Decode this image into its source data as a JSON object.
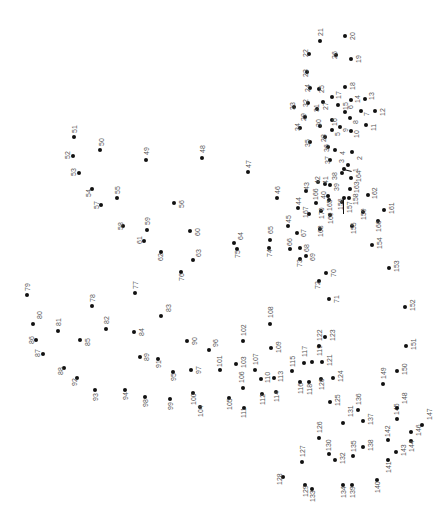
{
  "puzzle": {
    "type": "connect-the-dots",
    "orientation": "rotated-90",
    "dots": [
      {
        "n": "1",
        "x": 348,
        "y": 165,
        "lx": 352,
        "ly": 172
      },
      {
        "n": "2",
        "x": 352,
        "y": 152,
        "lx": 356,
        "ly": 160
      },
      {
        "n": "3",
        "x": 344,
        "y": 169,
        "lx": 338,
        "ly": 163
      },
      {
        "n": "4",
        "x": 335,
        "y": 150,
        "lx": 339,
        "ly": 155
      },
      {
        "n": "5",
        "x": 332,
        "y": 130,
        "lx": 334,
        "ly": 136
      },
      {
        "n": "6",
        "x": 345,
        "y": 112,
        "lx": 347,
        "ly": 109
      },
      {
        "n": "7",
        "x": 361,
        "y": 111,
        "lx": 363,
        "ly": 116
      },
      {
        "n": "8",
        "x": 350,
        "y": 118,
        "lx": 352,
        "ly": 124
      },
      {
        "n": "9",
        "x": 340,
        "y": 127,
        "lx": 342,
        "ly": 132
      },
      {
        "n": "10",
        "x": 351,
        "y": 131,
        "lx": 353,
        "ly": 138
      },
      {
        "n": "11",
        "x": 366,
        "y": 125,
        "lx": 370,
        "ly": 131
      },
      {
        "n": "12",
        "x": 375,
        "y": 111,
        "lx": 379,
        "ly": 116
      },
      {
        "n": "13",
        "x": 365,
        "y": 99,
        "lx": 368,
        "ly": 100
      },
      {
        "n": "14",
        "x": 351,
        "y": 100,
        "lx": 354,
        "ly": 103
      },
      {
        "n": "15",
        "x": 338,
        "y": 105,
        "lx": 342,
        "ly": 110
      },
      {
        "n": "16",
        "x": 332,
        "y": 120,
        "lx": 331,
        "ly": 126
      },
      {
        "n": "17",
        "x": 332,
        "y": 97,
        "lx": 335,
        "ly": 99
      },
      {
        "n": "18",
        "x": 345,
        "y": 87,
        "lx": 349,
        "ly": 90
      },
      {
        "n": "19",
        "x": 351,
        "y": 59,
        "lx": 355,
        "ly": 63
      },
      {
        "n": "20",
        "x": 345,
        "y": 36,
        "lx": 349,
        "ly": 40
      },
      {
        "n": "21",
        "x": 320,
        "y": 41,
        "lx": 317,
        "ly": 36
      },
      {
        "n": "22",
        "x": 309,
        "y": 54,
        "lx": 302,
        "ly": 57
      },
      {
        "n": "23",
        "x": 307,
        "y": 72,
        "lx": 302,
        "ly": 77
      },
      {
        "n": "24",
        "x": 310,
        "y": 88,
        "lx": 304,
        "ly": 92
      },
      {
        "n": "25",
        "x": 319,
        "y": 89,
        "lx": 318,
        "ly": 93
      },
      {
        "n": "26",
        "x": 336,
        "y": 55,
        "lx": 331,
        "ly": 59
      },
      {
        "n": "27",
        "x": 323,
        "y": 102,
        "lx": 322,
        "ly": 110
      },
      {
        "n": "28",
        "x": 325,
        "y": 137,
        "lx": 320,
        "ly": 142
      },
      {
        "n": "29",
        "x": 305,
        "y": 117,
        "lx": 300,
        "ly": 121
      },
      {
        "n": "30",
        "x": 320,
        "y": 126,
        "lx": 315,
        "ly": 127
      },
      {
        "n": "31",
        "x": 317,
        "y": 109,
        "lx": 313,
        "ly": 112
      },
      {
        "n": "32",
        "x": 308,
        "y": 103,
        "lx": 302,
        "ly": 107
      },
      {
        "n": "33",
        "x": 294,
        "y": 107,
        "lx": 289,
        "ly": 110
      },
      {
        "n": "34",
        "x": 300,
        "y": 128,
        "lx": 294,
        "ly": 131
      },
      {
        "n": "35",
        "x": 310,
        "y": 142,
        "lx": 304,
        "ly": 147
      },
      {
        "n": "36",
        "x": 328,
        "y": 147,
        "lx": 323,
        "ly": 152
      },
      {
        "n": "37",
        "x": 330,
        "y": 160,
        "lx": 324,
        "ly": 164
      },
      {
        "n": "38",
        "x": 342,
        "y": 173,
        "lx": 331,
        "ly": 180
      },
      {
        "n": "39",
        "x": 330,
        "y": 185,
        "lx": 333,
        "ly": 191
      },
      {
        "n": "40",
        "x": 328,
        "y": 196,
        "lx": 320,
        "ly": 199
      },
      {
        "n": "41",
        "x": 325,
        "y": 184,
        "lx": 322,
        "ly": 184
      },
      {
        "n": "42",
        "x": 318,
        "y": 182,
        "lx": 314,
        "ly": 184
      },
      {
        "n": "43",
        "x": 306,
        "y": 191,
        "lx": 303,
        "ly": 190
      },
      {
        "n": "44",
        "x": 298,
        "y": 208,
        "lx": 295,
        "ly": 205
      },
      {
        "n": "45",
        "x": 288,
        "y": 226,
        "lx": 285,
        "ly": 223
      },
      {
        "n": "46",
        "x": 277,
        "y": 198,
        "lx": 274,
        "ly": 194
      },
      {
        "n": "47",
        "x": 248,
        "y": 172,
        "lx": 245,
        "ly": 168
      },
      {
        "n": "48",
        "x": 202,
        "y": 158,
        "lx": 199,
        "ly": 153
      },
      {
        "n": "49",
        "x": 146,
        "y": 160,
        "lx": 143,
        "ly": 155
      },
      {
        "n": "50",
        "x": 100,
        "y": 150,
        "lx": 98,
        "ly": 146
      },
      {
        "n": "51",
        "x": 74,
        "y": 137,
        "lx": 71,
        "ly": 133
      },
      {
        "n": "52",
        "x": 73,
        "y": 156,
        "lx": 64,
        "ly": 159
      },
      {
        "n": "53",
        "x": 79,
        "y": 173,
        "lx": 70,
        "ly": 176
      },
      {
        "n": "54",
        "x": 92,
        "y": 189,
        "lx": 85,
        "ly": 197
      },
      {
        "n": "55",
        "x": 117,
        "y": 198,
        "lx": 114,
        "ly": 194
      },
      {
        "n": "56",
        "x": 174,
        "y": 203,
        "lx": 178,
        "ly": 208
      },
      {
        "n": "57",
        "x": 101,
        "y": 205,
        "lx": 93,
        "ly": 209
      },
      {
        "n": "58",
        "x": 123,
        "y": 226,
        "lx": 117,
        "ly": 230
      },
      {
        "n": "59",
        "x": 147,
        "y": 230,
        "lx": 144,
        "ly": 225
      },
      {
        "n": "60",
        "x": 190,
        "y": 231,
        "lx": 194,
        "ly": 236
      },
      {
        "n": "61",
        "x": 144,
        "y": 241,
        "lx": 136,
        "ly": 244
      },
      {
        "n": "62",
        "x": 161,
        "y": 252,
        "lx": 157,
        "ly": 261
      },
      {
        "n": "63",
        "x": 193,
        "y": 260,
        "lx": 195,
        "ly": 257
      },
      {
        "n": "64",
        "x": 234,
        "y": 243,
        "lx": 237,
        "ly": 240
      },
      {
        "n": "65",
        "x": 270,
        "y": 240,
        "lx": 267,
        "ly": 234
      },
      {
        "n": "66",
        "x": 290,
        "y": 249,
        "lx": 286,
        "ly": 246
      },
      {
        "n": "67",
        "x": 297,
        "y": 233,
        "lx": 300,
        "ly": 237
      },
      {
        "n": "68",
        "x": 300,
        "y": 248,
        "lx": 303,
        "ly": 252
      },
      {
        "n": "69",
        "x": 306,
        "y": 256,
        "lx": 309,
        "ly": 261
      },
      {
        "n": "70",
        "x": 326,
        "y": 273,
        "lx": 330,
        "ly": 277
      },
      {
        "n": "71",
        "x": 329,
        "y": 299,
        "lx": 333,
        "ly": 303
      },
      {
        "n": "72",
        "x": 319,
        "y": 281,
        "lx": 314,
        "ly": 289
      },
      {
        "n": "73",
        "x": 300,
        "y": 259,
        "lx": 296,
        "ly": 267
      },
      {
        "n": "74",
        "x": 269,
        "y": 248,
        "lx": 266,
        "ly": 257
      },
      {
        "n": "75",
        "x": 237,
        "y": 249,
        "lx": 234,
        "ly": 258
      },
      {
        "n": "76",
        "x": 181,
        "y": 272,
        "lx": 178,
        "ly": 281
      },
      {
        "n": "77",
        "x": 135,
        "y": 293,
        "lx": 132,
        "ly": 289
      },
      {
        "n": "78",
        "x": 92,
        "y": 306,
        "lx": 89,
        "ly": 302
      },
      {
        "n": "79",
        "x": 27,
        "y": 295,
        "lx": 24,
        "ly": 291
      },
      {
        "n": "80",
        "x": 33,
        "y": 324,
        "lx": 36,
        "ly": 319
      },
      {
        "n": "81",
        "x": 58,
        "y": 331,
        "lx": 55,
        "ly": 326
      },
      {
        "n": "82",
        "x": 106,
        "y": 329,
        "lx": 103,
        "ly": 324
      },
      {
        "n": "83",
        "x": 161,
        "y": 316,
        "lx": 165,
        "ly": 312
      },
      {
        "n": "84",
        "x": 134,
        "y": 332,
        "lx": 138,
        "ly": 336
      },
      {
        "n": "85",
        "x": 80,
        "y": 340,
        "lx": 84,
        "ly": 346
      },
      {
        "n": "86",
        "x": 36,
        "y": 340,
        "lx": 28,
        "ly": 344
      },
      {
        "n": "87",
        "x": 43,
        "y": 354,
        "lx": 34,
        "ly": 357
      },
      {
        "n": "88",
        "x": 64,
        "y": 368,
        "lx": 57,
        "ly": 375
      },
      {
        "n": "89",
        "x": 140,
        "y": 357,
        "lx": 143,
        "ly": 361
      },
      {
        "n": "90",
        "x": 187,
        "y": 341,
        "lx": 191,
        "ly": 345
      },
      {
        "n": "91",
        "x": 158,
        "y": 359,
        "lx": 155,
        "ly": 368
      },
      {
        "n": "92",
        "x": 77,
        "y": 378,
        "lx": 71,
        "ly": 386
      },
      {
        "n": "93",
        "x": 95,
        "y": 390,
        "lx": 92,
        "ly": 401
      },
      {
        "n": "94",
        "x": 125,
        "y": 390,
        "lx": 122,
        "ly": 400
      },
      {
        "n": "95",
        "x": 173,
        "y": 372,
        "lx": 170,
        "ly": 381
      },
      {
        "n": "96",
        "x": 209,
        "y": 350,
        "lx": 212,
        "ly": 347
      },
      {
        "n": "97",
        "x": 191,
        "y": 370,
        "lx": 195,
        "ly": 374
      },
      {
        "n": "98",
        "x": 145,
        "y": 397,
        "lx": 142,
        "ly": 407
      },
      {
        "n": "99",
        "x": 170,
        "y": 399,
        "lx": 167,
        "ly": 410
      },
      {
        "n": "100",
        "x": 193,
        "y": 393,
        "lx": 190,
        "ly": 405
      },
      {
        "n": "101",
        "x": 220,
        "y": 370,
        "lx": 216,
        "ly": 367
      },
      {
        "n": "102",
        "x": 243,
        "y": 341,
        "lx": 240,
        "ly": 336
      },
      {
        "n": "103",
        "x": 236,
        "y": 364,
        "lx": 240,
        "ly": 368
      },
      {
        "n": "104",
        "x": 200,
        "y": 407,
        "lx": 197,
        "ly": 417
      },
      {
        "n": "105",
        "x": 229,
        "y": 398,
        "lx": 226,
        "ly": 410
      },
      {
        "n": "106",
        "x": 243,
        "y": 388,
        "lx": 238,
        "ly": 383
      },
      {
        "n": "107",
        "x": 255,
        "y": 370,
        "lx": 252,
        "ly": 365
      },
      {
        "n": "108",
        "x": 270,
        "y": 324,
        "lx": 267,
        "ly": 318
      },
      {
        "n": "109",
        "x": 271,
        "y": 348,
        "lx": 275,
        "ly": 353
      },
      {
        "n": "110",
        "x": 261,
        "y": 379,
        "lx": 264,
        "ly": 383
      },
      {
        "n": "111",
        "x": 244,
        "y": 408,
        "lx": 240,
        "ly": 418
      },
      {
        "n": "112",
        "x": 262,
        "y": 394,
        "lx": 259,
        "ly": 405
      },
      {
        "n": "113",
        "x": 274,
        "y": 378,
        "lx": 277,
        "ly": 382
      },
      {
        "n": "114",
        "x": 276,
        "y": 392,
        "lx": 273,
        "ly": 402
      },
      {
        "n": "115",
        "x": 292,
        "y": 371,
        "lx": 289,
        "ly": 367
      },
      {
        "n": "116",
        "x": 300,
        "y": 382,
        "lx": 297,
        "ly": 394
      },
      {
        "n": "117",
        "x": 304,
        "y": 363,
        "lx": 301,
        "ly": 357
      },
      {
        "n": "118",
        "x": 309,
        "y": 382,
        "lx": 306,
        "ly": 395
      },
      {
        "n": "119",
        "x": 312,
        "y": 362,
        "lx": 316,
        "ly": 356
      },
      {
        "n": "120",
        "x": 321,
        "y": 379,
        "lx": 318,
        "ly": 390
      },
      {
        "n": "121",
        "x": 322,
        "y": 362,
        "lx": 326,
        "ly": 366
      },
      {
        "n": "122",
        "x": 319,
        "y": 346,
        "lx": 316,
        "ly": 341
      },
      {
        "n": "123",
        "x": 325,
        "y": 337,
        "lx": 329,
        "ly": 341
      },
      {
        "n": "124",
        "x": 333,
        "y": 378,
        "lx": 337,
        "ly": 382
      },
      {
        "n": "125",
        "x": 330,
        "y": 402,
        "lx": 334,
        "ly": 406
      },
      {
        "n": "126",
        "x": 319,
        "y": 438,
        "lx": 316,
        "ly": 433
      },
      {
        "n": "127",
        "x": 302,
        "y": 462,
        "lx": 299,
        "ly": 457
      },
      {
        "n": "128",
        "x": 283,
        "y": 477,
        "lx": 276,
        "ly": 485
      },
      {
        "n": "129",
        "x": 305,
        "y": 485,
        "lx": 302,
        "ly": 497
      },
      {
        "n": "130",
        "x": 329,
        "y": 454,
        "lx": 325,
        "ly": 451
      },
      {
        "n": "131",
        "x": 343,
        "y": 423,
        "lx": 347,
        "ly": 417
      },
      {
        "n": "132",
        "x": 335,
        "y": 460,
        "lx": 339,
        "ly": 464
      },
      {
        "n": "133",
        "x": 312,
        "y": 489,
        "lx": 309,
        "ly": 502
      },
      {
        "n": "134",
        "x": 343,
        "y": 485,
        "lx": 340,
        "ly": 498
      },
      {
        "n": "135",
        "x": 353,
        "y": 456,
        "lx": 350,
        "ly": 452
      },
      {
        "n": "136",
        "x": 358,
        "y": 410,
        "lx": 355,
        "ly": 405
      },
      {
        "n": "137",
        "x": 363,
        "y": 421,
        "lx": 367,
        "ly": 425
      },
      {
        "n": "138",
        "x": 363,
        "y": 447,
        "lx": 367,
        "ly": 451
      },
      {
        "n": "139",
        "x": 352,
        "y": 485,
        "lx": 349,
        "ly": 498
      },
      {
        "n": "140",
        "x": 377,
        "y": 480,
        "lx": 374,
        "ly": 493
      },
      {
        "n": "141",
        "x": 388,
        "y": 460,
        "lx": 385,
        "ly": 473
      },
      {
        "n": "142",
        "x": 388,
        "y": 440,
        "lx": 384,
        "ly": 437
      },
      {
        "n": "143",
        "x": 396,
        "y": 452,
        "lx": 400,
        "ly": 456
      },
      {
        "n": "144",
        "x": 411,
        "y": 441,
        "lx": 408,
        "ly": 452
      },
      {
        "n": "145",
        "x": 397,
        "y": 419,
        "lx": 393,
        "ly": 415
      },
      {
        "n": "146",
        "x": 411,
        "y": 432,
        "lx": 415,
        "ly": 436
      },
      {
        "n": "147",
        "x": 422,
        "y": 425,
        "lx": 426,
        "ly": 420
      },
      {
        "n": "148",
        "x": 397,
        "y": 408,
        "lx": 401,
        "ly": 404
      },
      {
        "n": "149",
        "x": 383,
        "y": 384,
        "lx": 380,
        "ly": 379
      },
      {
        "n": "150",
        "x": 397,
        "y": 371,
        "lx": 401,
        "ly": 375
      },
      {
        "n": "151",
        "x": 406,
        "y": 346,
        "lx": 410,
        "ly": 350
      },
      {
        "n": "152",
        "x": 405,
        "y": 307,
        "lx": 409,
        "ly": 311
      },
      {
        "n": "153",
        "x": 389,
        "y": 268,
        "lx": 393,
        "ly": 272
      },
      {
        "n": "154",
        "x": 372,
        "y": 245,
        "lx": 376,
        "ly": 249
      },
      {
        "n": "155",
        "x": 352,
        "y": 226,
        "lx": 350,
        "ly": 234
      },
      {
        "n": "156",
        "x": 342,
        "y": 202,
        "lx": 337,
        "ly": 210
      },
      {
        "n": "157",
        "x": 344,
        "y": 198,
        "lx": 346,
        "ly": 213
      },
      {
        "n": "158",
        "x": 349,
        "y": 198,
        "lx": 352,
        "ly": 205
      },
      {
        "n": "159",
        "x": 363,
        "y": 212,
        "lx": 360,
        "ly": 220
      },
      {
        "n": "160",
        "x": 378,
        "y": 221,
        "lx": 375,
        "ly": 232
      },
      {
        "n": "161",
        "x": 384,
        "y": 210,
        "lx": 388,
        "ly": 214
      },
      {
        "n": "162",
        "x": 368,
        "y": 195,
        "lx": 371,
        "ly": 199
      },
      {
        "n": "163",
        "x": 350,
        "y": 189,
        "lx": 353,
        "ly": 193
      },
      {
        "n": "164",
        "x": 351,
        "y": 178,
        "lx": 355,
        "ly": 182
      },
      {
        "n": "165",
        "x": 329,
        "y": 200,
        "lx": 326,
        "ly": 211
      },
      {
        "n": "166",
        "x": 316,
        "y": 203,
        "lx": 312,
        "ly": 200
      },
      {
        "n": "167",
        "x": 309,
        "y": 214,
        "lx": 302,
        "ly": 218
      },
      {
        "n": "168",
        "x": 320,
        "y": 229,
        "lx": 317,
        "ly": 237
      },
      {
        "n": "169",
        "x": 330,
        "y": 215,
        "lx": 327,
        "ly": 224
      },
      {
        "n": "170",
        "x": 321,
        "y": 211,
        "lx": 318,
        "ly": 219
      }
    ]
  }
}
